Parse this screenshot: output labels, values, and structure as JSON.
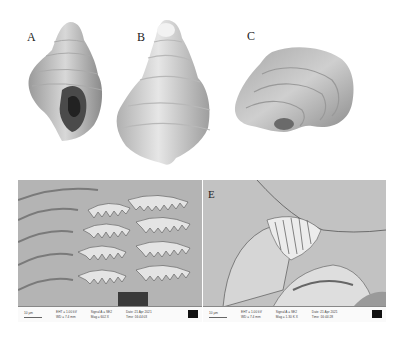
{
  "figure": {
    "panels": [
      {
        "id": "A",
        "label": "A",
        "kind": "shell-apertural-view"
      },
      {
        "id": "B",
        "label": "B",
        "kind": "shell-abapertural-view"
      },
      {
        "id": "C",
        "label": "C",
        "kind": "shell-apical-view"
      },
      {
        "id": "D",
        "label": "D",
        "kind": "sem-radula"
      },
      {
        "id": "E",
        "label": "E",
        "kind": "sem-radula"
      }
    ],
    "sem_databars": [
      {
        "scale": "10 µm",
        "eht": "EHT = 1.00 kV",
        "wd": "WD = 7.4 mm",
        "signal": "Signal A = SE2",
        "mag": "Mag = 602 X",
        "date": "Date :21 Apr 2021",
        "time": "Time :16:44:03"
      },
      {
        "scale": "10 µm",
        "eht": "EHT = 1.00 kV",
        "wd": "WD = 7.4 mm",
        "signal": "Signal A = SE2",
        "mag": "Mag = 1.30 K X",
        "date": "Date :21 Apr 2021",
        "time": "Time :16:44:28"
      }
    ]
  }
}
